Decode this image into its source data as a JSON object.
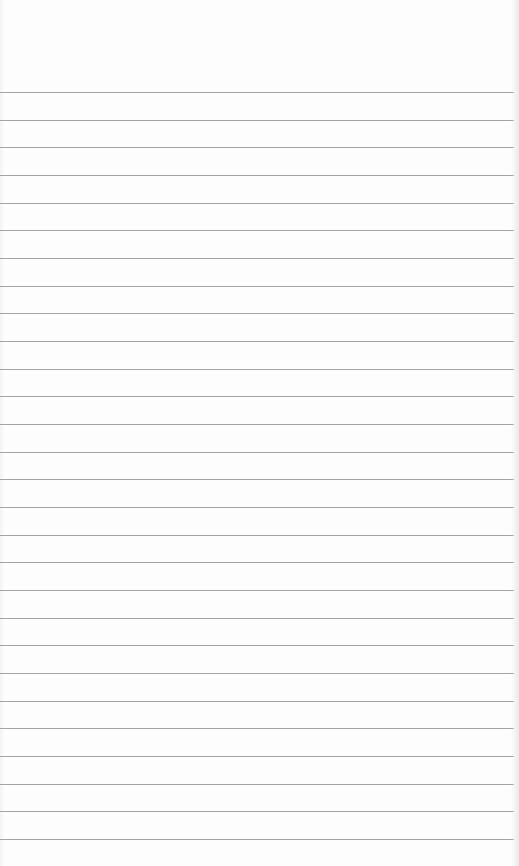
{
  "paper": {
    "description": "blank ruled notebook paper",
    "line_color": "#a4a4a4",
    "background_color": "#fdfdfd",
    "rules": {
      "count": 28,
      "first_y": 92,
      "spacing": 27.67
    }
  }
}
